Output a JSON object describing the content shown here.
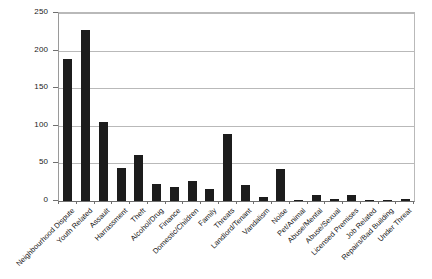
{
  "chart_data": {
    "type": "bar",
    "title": "",
    "subtitle": "",
    "xlabel": "",
    "ylabel": "",
    "ylim": [
      0,
      250
    ],
    "yticks": [
      0,
      50,
      100,
      150,
      200,
      250
    ],
    "grid": "horizontal",
    "legend": "none",
    "bar_color": "#1c1c1c",
    "plot_background": "#ffffff",
    "gridline_color": "#b9b9b9",
    "axis_color": "#6f6f6f",
    "categories": [
      "Neighbourhood Dispute",
      "Youth Related",
      "Assault",
      "Harrassment",
      "Theft",
      "Alcohol/Drug",
      "Finance",
      "Domestic/Children",
      "Family",
      "Threats",
      "Landlord/Tenant",
      "Vandalism",
      "Noise",
      "Pet/Animal",
      "Abuse/Mental",
      "Abuse/Sexual",
      "Licensed Premises",
      "Job Related",
      "Repairs/Bad Building",
      "Under Threat"
    ],
    "values": [
      189,
      227,
      105,
      44,
      61,
      23,
      18,
      27,
      16,
      89,
      21,
      6,
      42,
      1,
      8,
      3,
      8,
      1,
      2,
      3
    ]
  }
}
